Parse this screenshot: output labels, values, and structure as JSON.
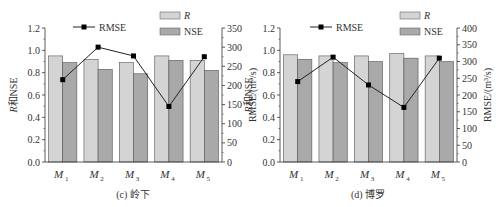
{
  "chart_data": [
    {
      "type": "bar",
      "title": "(c) 岭下",
      "categories": [
        "M1",
        "M2",
        "M3",
        "M4",
        "M5"
      ],
      "xlabel": "",
      "ylabel": "R和NSE",
      "ylabel_right": "RMSE/(m³/s)",
      "ylim": [
        0,
        1.2
      ],
      "ylim_right": [
        0,
        350
      ],
      "yticks": [
        0.0,
        0.2,
        0.4,
        0.6,
        0.8,
        1.0,
        1.2
      ],
      "yticks_right": [
        0,
        50,
        100,
        150,
        200,
        250,
        300,
        350
      ],
      "series": [
        {
          "name": "R",
          "type": "bar",
          "color": "#d4d4d4",
          "values": [
            0.95,
            0.92,
            0.89,
            0.95,
            0.91
          ]
        },
        {
          "name": "NSE",
          "type": "bar",
          "color": "#a9a9a9",
          "values": [
            0.89,
            0.83,
            0.79,
            0.91,
            0.82
          ]
        },
        {
          "name": "RMSE",
          "type": "line",
          "axis": "right",
          "color": "#000000",
          "values": [
            215,
            300,
            277,
            145,
            275
          ]
        }
      ],
      "legend": [
        "RMSE",
        "R",
        "NSE"
      ]
    },
    {
      "type": "bar",
      "title": "(d) 博罗",
      "categories": [
        "M1",
        "M2",
        "M3",
        "M4",
        "M5"
      ],
      "xlabel": "",
      "ylabel": "R和NSE",
      "ylabel_right": "RMSE/(m³/s)",
      "ylim": [
        0,
        1.2
      ],
      "ylim_right": [
        0,
        400
      ],
      "yticks": [
        0.0,
        0.2,
        0.4,
        0.6,
        0.8,
        1.0,
        1.2
      ],
      "yticks_right": [
        0,
        50,
        100,
        150,
        200,
        250,
        300,
        350,
        400
      ],
      "series": [
        {
          "name": "R",
          "type": "bar",
          "color": "#d4d4d4",
          "values": [
            0.96,
            0.95,
            0.95,
            0.97,
            0.95
          ]
        },
        {
          "name": "NSE",
          "type": "bar",
          "color": "#a9a9a9",
          "values": [
            0.92,
            0.89,
            0.9,
            0.93,
            0.9
          ]
        },
        {
          "name": "RMSE",
          "type": "line",
          "axis": "right",
          "color": "#000000",
          "values": [
            240,
            313,
            230,
            163,
            310
          ]
        }
      ],
      "legend": [
        "RMSE",
        "R",
        "NSE"
      ]
    }
  ],
  "labels": {
    "left_ylabel_italic": "R",
    "left_ylabel_rest": "和NSE",
    "right_ylabel": "RMSE/(m³/s)",
    "legend_rmse": "RMSE",
    "legend_r": "R",
    "legend_nse": "NSE",
    "cat_prefix": "M",
    "cat_subs": [
      "1",
      "2",
      "3",
      "4",
      "5"
    ],
    "caption_c": "(c) 岭下",
    "caption_d": "(d) 博罗"
  }
}
